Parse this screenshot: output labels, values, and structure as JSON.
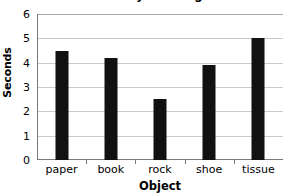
{
  "chart_data": {
    "type": "bar",
    "title": "Results of My Investigation",
    "title_clipped": true,
    "categories": [
      "paper",
      "book",
      "rock",
      "shoe",
      "tissue"
    ],
    "values": [
      4.5,
      4.2,
      2.5,
      3.9,
      5.0
    ],
    "xlabel": "Object",
    "ylabel": "Seconds",
    "ylim": [
      0,
      6
    ],
    "ytick_labels": [
      "0",
      "1",
      "2",
      "3",
      "4",
      "5",
      "6"
    ],
    "ytick_values": [
      0,
      1,
      2,
      3,
      4,
      5,
      6
    ],
    "grid": true,
    "legend": false,
    "bar_color": "#111111",
    "gridline_color": "#c9c9c9",
    "axis_color": "#7a7a7a",
    "background_color": "#ffffff"
  }
}
